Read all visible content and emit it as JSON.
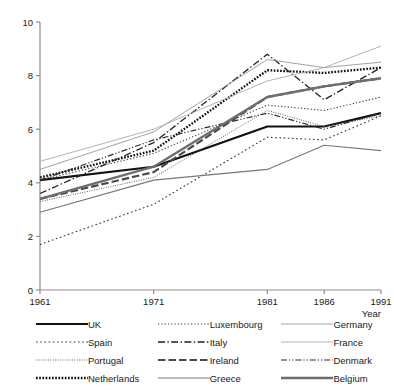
{
  "chart_data": {
    "type": "line",
    "title": "",
    "xlabel": "Year",
    "ylabel": "",
    "x": [
      1961,
      1971,
      1981,
      1986,
      1991
    ],
    "xtick_labels": [
      "1961",
      "1971",
      "1981",
      "1986",
      "1991"
    ],
    "ytick_labels": [
      "0",
      "2",
      "4",
      "6",
      "8",
      "10"
    ],
    "yticks": [
      0,
      2,
      4,
      6,
      8,
      10
    ],
    "ylim": [
      0,
      10
    ],
    "xlim": [
      1961,
      1991
    ],
    "grid": false,
    "legend_position": "below-axes",
    "legend_columns": 3,
    "series": [
      {
        "name": "UK",
        "style": "solid-thick",
        "color": "#111111",
        "values": [
          4.1,
          4.6,
          6.1,
          6.1,
          6.6
        ]
      },
      {
        "name": "Spain",
        "style": "dotted-coarse",
        "color": "#333333",
        "values": [
          1.7,
          3.2,
          5.7,
          5.6,
          6.5
        ]
      },
      {
        "name": "Portugal",
        "style": "dotted-fine",
        "color": "#555555",
        "values": [
          3.3,
          4.2,
          6.7,
          6.1,
          6.5
        ]
      },
      {
        "name": "Netherlands",
        "style": "dotted-thick",
        "color": "#111111",
        "values": [
          4.2,
          5.2,
          8.2,
          8.1,
          8.3
        ]
      },
      {
        "name": "Luxembourg",
        "style": "dotted-medium",
        "color": "#444444",
        "values": [
          4.1,
          5.1,
          6.9,
          6.7,
          7.2
        ]
      },
      {
        "name": "Italy",
        "style": "dash-dot",
        "color": "#222222",
        "values": [
          3.6,
          5.5,
          8.8,
          7.1,
          8.3
        ]
      },
      {
        "name": "Ireland",
        "style": "dash-thick",
        "color": "#4a4a4a",
        "values": [
          3.4,
          4.4,
          7.2,
          7.6,
          7.9
        ]
      },
      {
        "name": "Greece",
        "style": "solid-medium",
        "color": "#777777",
        "values": [
          2.9,
          4.1,
          4.5,
          5.4,
          5.2
        ]
      },
      {
        "name": "Germany",
        "style": "solid-thin",
        "color": "#8a8a8a",
        "values": [
          4.5,
          5.9,
          8.6,
          8.3,
          8.5
        ]
      },
      {
        "name": "France",
        "style": "solid-light",
        "color": "#aaaaaa",
        "values": [
          4.8,
          6.0,
          7.8,
          8.3,
          9.1
        ]
      },
      {
        "name": "Denmark",
        "style": "dash-dot-dot",
        "color": "#2e2e2e",
        "values": [
          4.1,
          5.6,
          6.6,
          6.0,
          6.6
        ]
      },
      {
        "name": "Belgium",
        "style": "solid-gray-thick",
        "color": "#6e6e6e",
        "values": [
          3.4,
          4.6,
          7.2,
          7.6,
          7.9
        ]
      }
    ]
  },
  "axes": {
    "y_label_top": "10",
    "x_axis_title": "Year"
  },
  "legend": {
    "columns": [
      [
        {
          "label": "UK"
        },
        {
          "label": "Spain"
        },
        {
          "label": "Portugal"
        },
        {
          "label": "Netherlands"
        }
      ],
      [
        {
          "label": "Luxembourg"
        },
        {
          "label": "Italy"
        },
        {
          "label": "Ireland"
        },
        {
          "label": "Greece"
        }
      ],
      [
        {
          "label": "Germany"
        },
        {
          "label": "France"
        },
        {
          "label": "Denmark"
        },
        {
          "label": "Belgium"
        }
      ]
    ]
  },
  "caption": {
    "text": ""
  }
}
